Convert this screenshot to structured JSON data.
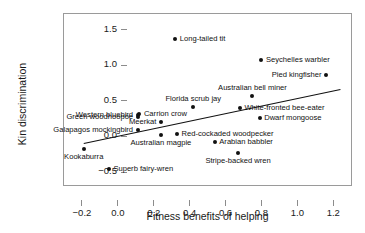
{
  "chart_data": {
    "type": "scatter",
    "title": "",
    "xlabel": "Fitness benefits of helping",
    "ylabel": "Kin discrimination",
    "xlim": [
      -0.3,
      1.31
    ],
    "ylim": [
      -0.71,
      1.72
    ],
    "xticks": [
      -0.2,
      0.0,
      0.2,
      0.4,
      0.6,
      0.8,
      1.0,
      1.2
    ],
    "xtick_labels": [
      "−0.2",
      "0.0",
      "0.2",
      "0.4",
      "0.6",
      "0.8",
      "1.0",
      "1.2"
    ],
    "yticks": [
      -0.5,
      0.0,
      0.5,
      1.0,
      1.5
    ],
    "ytick_labels": [
      "−0.5",
      "0.0",
      "0.5",
      "1.0",
      "1.5"
    ],
    "grid": false,
    "legend": "none",
    "points": [
      {
        "label": "Long-tailed tit",
        "x": 0.32,
        "y": 1.37,
        "label_pos": "r"
      },
      {
        "label": "Seychelles warbler",
        "x": 0.8,
        "y": 1.08,
        "label_pos": "r"
      },
      {
        "label": "Pied kingfisher",
        "x": 1.16,
        "y": 0.87,
        "label_pos": "l"
      },
      {
        "label": "Australian bell miner",
        "x": 0.75,
        "y": 0.57,
        "label_pos": "above"
      },
      {
        "label": "Florida scrub jay",
        "x": 0.42,
        "y": 0.41,
        "label_pos": "above"
      },
      {
        "label": "White-fronted bee-eater",
        "x": 0.68,
        "y": 0.4,
        "label_pos": "r"
      },
      {
        "label": "Carrion crow",
        "x": 0.12,
        "y": 0.32,
        "label_pos": "r"
      },
      {
        "label": "Western bluebird",
        "x": 0.11,
        "y": 0.3,
        "label_pos": "l"
      },
      {
        "label": "Green woodhoopoe",
        "x": 0.11,
        "y": 0.27,
        "label_pos": "l"
      },
      {
        "label": "Dwarf mongoose",
        "x": 0.79,
        "y": 0.26,
        "label_pos": "r"
      },
      {
        "label": "Meerkat",
        "x": 0.24,
        "y": 0.21,
        "label_pos": "l"
      },
      {
        "label": "Galapagos mockingbird",
        "x": 0.11,
        "y": 0.09,
        "label_pos": "l"
      },
      {
        "label": "Red-cockaded woodpecker",
        "x": 0.33,
        "y": 0.04,
        "label_pos": "r"
      },
      {
        "label": "Australian magpie",
        "x": 0.24,
        "y": 0.02,
        "label_pos": "below"
      },
      {
        "label": "Arabian babbler",
        "x": 0.54,
        "y": -0.08,
        "label_pos": "r"
      },
      {
        "label": "Kookaburra",
        "x": -0.19,
        "y": -0.17,
        "label_pos": "below"
      },
      {
        "label": "Stripe-backed wren",
        "x": 0.67,
        "y": -0.23,
        "label_pos": "below"
      },
      {
        "label": "Superb fairy-wren",
        "x": -0.05,
        "y": -0.46,
        "label_pos": "r"
      }
    ],
    "trendline": {
      "x0": -0.19,
      "y0": -0.1,
      "x1": 1.24,
      "y0_end": 0.66
    }
  }
}
